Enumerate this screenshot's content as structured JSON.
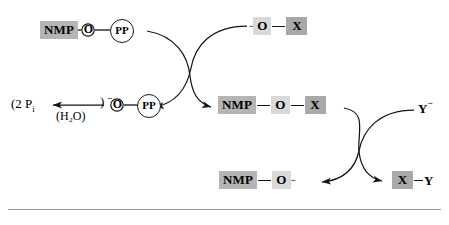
{
  "diagram": {
    "type": "reaction-scheme",
    "colors": {
      "chip_nmp": "#b5b5b5",
      "chip_o": "#d9d9d9",
      "chip_x": "#a9a9a9",
      "stroke": "#141414",
      "rule": "#9a9a9a",
      "background": "#ffffff"
    },
    "nodes": {
      "reactant_top_left": {
        "name": "nmp-o-pp",
        "parts": {
          "nmp": "NMP",
          "o": "O",
          "pp": "PP"
        }
      },
      "reactant_top_right": {
        "name": "o-minus-x",
        "parts": {
          "charge": "−",
          "o": "O",
          "x": "X"
        }
      },
      "product_left": {
        "name": "pyrophosphate-hydrolysis",
        "parts": {
          "phosphate": "(2 P",
          "phosphate_sub": "i",
          "water": "(H₂O)",
          "charge": "−",
          "o": "O",
          "pp": "PP"
        }
      },
      "intermediate_middle": {
        "name": "nmp-o-x",
        "parts": {
          "nmp": "NMP",
          "o": "O",
          "x": "X"
        }
      },
      "reactant_right": {
        "name": "y-minus",
        "parts": {
          "y": "Y",
          "charge": "−"
        }
      },
      "product_bottom_left": {
        "name": "nmp-o-minus",
        "parts": {
          "nmp": "NMP",
          "o": "O",
          "charge": "−"
        }
      },
      "product_bottom_right": {
        "name": "x-y",
        "parts": {
          "x": "X",
          "y": "Y"
        }
      }
    },
    "arrows": [
      {
        "name": "arrow-top-left-to-middle",
        "from": "reactant_top_left",
        "to": "intermediate_middle",
        "style": "curved"
      },
      {
        "name": "arrow-top-right-to-product-left",
        "from": "reactant_top_right",
        "to": "product_left",
        "style": "curved"
      },
      {
        "name": "arrow-hydrolysis-left",
        "from": "product_left_pp",
        "to": "phosphates",
        "style": "straight",
        "label": "(H₂O)"
      },
      {
        "name": "arrow-middle-to-bottom-left",
        "from": "intermediate_middle",
        "to": "product_bottom_left",
        "style": "curved"
      },
      {
        "name": "arrow-right-to-bottom-right",
        "from": "reactant_right",
        "to": "product_bottom_right",
        "style": "curved"
      }
    ],
    "rule": {
      "name": "bottom-divider"
    }
  }
}
